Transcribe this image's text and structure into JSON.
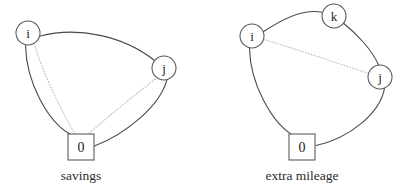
{
  "figure": {
    "width": 405,
    "height": 194,
    "background": "#ffffff",
    "edge_solid_color": "#4a4a4a",
    "edge_dotted_color": "#bdbdbd",
    "node_stroke_color": "#555555",
    "node_fill_color": "#ffffff",
    "text_color": "#222222"
  },
  "panels": [
    {
      "id": "savings",
      "caption": "savings",
      "nodes": [
        {
          "id": "i",
          "label": "i",
          "shape": "circle",
          "cx": 28,
          "cy": 33,
          "r": 12
        },
        {
          "id": "j",
          "label": "j",
          "shape": "circle",
          "cx": 164,
          "cy": 68,
          "r": 12
        },
        {
          "id": "depot",
          "label": "0",
          "shape": "square",
          "x": 68,
          "y": 134,
          "w": 26,
          "h": 26
        }
      ],
      "edges": [
        {
          "from": "i",
          "to": "j",
          "style": "solid"
        },
        {
          "from": "i",
          "to": "depot",
          "style": "solid"
        },
        {
          "from": "j",
          "to": "depot",
          "style": "solid"
        },
        {
          "from": "i",
          "to": "depot",
          "style": "dotted"
        },
        {
          "from": "j",
          "to": "depot",
          "style": "dotted"
        }
      ]
    },
    {
      "id": "extra-mileage",
      "caption": "extra mileage",
      "nodes": [
        {
          "id": "i",
          "label": "i",
          "shape": "circle",
          "cx": 252,
          "cy": 36,
          "r": 12
        },
        {
          "id": "k",
          "label": "k",
          "shape": "circle",
          "cx": 334,
          "cy": 16,
          "r": 12
        },
        {
          "id": "j",
          "label": "j",
          "shape": "circle",
          "cx": 380,
          "cy": 77,
          "r": 12
        },
        {
          "id": "depot",
          "label": "0",
          "shape": "square",
          "x": 289,
          "y": 134,
          "w": 26,
          "h": 26
        }
      ],
      "edges": [
        {
          "from": "i",
          "to": "k",
          "style": "solid"
        },
        {
          "from": "k",
          "to": "j",
          "style": "solid"
        },
        {
          "from": "i",
          "to": "depot",
          "style": "solid"
        },
        {
          "from": "j",
          "to": "depot",
          "style": "solid"
        },
        {
          "from": "i",
          "to": "j",
          "style": "dotted"
        }
      ]
    }
  ],
  "labels": {
    "left_node_i": "i",
    "left_node_j": "j",
    "left_depot": "0",
    "left_caption": "savings",
    "right_node_i": "i",
    "right_node_k": "k",
    "right_node_j": "j",
    "right_depot": "0",
    "right_caption": "extra mileage"
  },
  "caption_positions": {
    "left": {
      "x": 81,
      "y": 180
    },
    "right": {
      "x": 302,
      "y": 180
    }
  }
}
